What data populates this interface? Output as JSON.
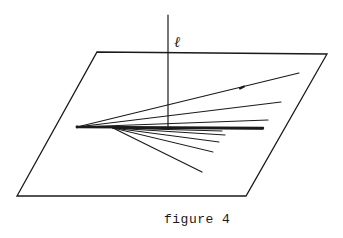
{
  "figure": {
    "caption": "figure 4",
    "line_label": "ℓ"
  },
  "colors": {
    "ink": "#1a1a1a",
    "background": "#ffffff"
  },
  "plane": {
    "corners": [
      [
        97,
        52
      ],
      [
        327,
        54
      ],
      [
        246,
        196
      ],
      [
        17,
        196
      ]
    ]
  },
  "vertical_line": {
    "x": 168,
    "y_top": 15,
    "y_bottom": 127
  },
  "rays": [
    {
      "from": [
        77,
        127
      ],
      "to": [
        299,
        73
      ],
      "width": 1.2
    },
    {
      "from": [
        77,
        127
      ],
      "to": [
        281,
        102
      ],
      "width": 1.2
    },
    {
      "from": [
        77,
        127
      ],
      "to": [
        268,
        120
      ],
      "width": 1.2
    },
    {
      "from": [
        77,
        127
      ],
      "to": [
        263,
        128
      ],
      "width": 2.4
    },
    {
      "from": [
        113,
        128
      ],
      "to": [
        263,
        129
      ],
      "width": 1.6
    },
    {
      "from": [
        113,
        128
      ],
      "to": [
        222,
        131
      ],
      "width": 1.0
    },
    {
      "from": [
        113,
        128
      ],
      "to": [
        225,
        135
      ],
      "width": 1.0
    },
    {
      "from": [
        113,
        128
      ],
      "to": [
        219,
        142
      ],
      "width": 1.0
    },
    {
      "from": [
        113,
        128
      ],
      "to": [
        213,
        152
      ],
      "width": 1.0
    },
    {
      "from": [
        113,
        128
      ],
      "to": [
        202,
        172
      ],
      "width": 1.2
    }
  ]
}
